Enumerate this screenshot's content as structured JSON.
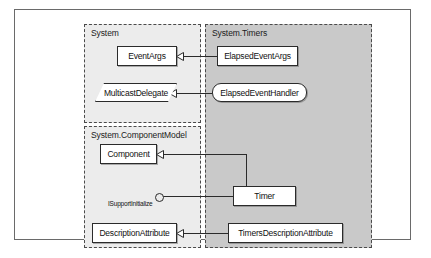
{
  "diagram": {
    "type": "uml-class-diagram",
    "colors": {
      "frame_border": "#6a6a6a",
      "package_border": "#4a4a4a",
      "package_fill_light": "#ececec",
      "package_fill_dark": "#c9c9c9",
      "node_fill": "#ffffff",
      "node_border": "#2b2b2b",
      "connector": "#2b2b2b"
    },
    "packages": [
      {
        "id": "system",
        "label": "System",
        "fill": "#ececec"
      },
      {
        "id": "componentmodel",
        "label": "System.ComponentModel",
        "fill": "#ececec"
      },
      {
        "id": "timers",
        "label": "System.Timers",
        "fill": "#c9c9c9"
      }
    ],
    "nodes": [
      {
        "id": "eventargs",
        "label": "EventArgs",
        "shape": "rect",
        "package": "system"
      },
      {
        "id": "multicastdelegate",
        "label": "MulticastDelegate",
        "shape": "parallelogram",
        "package": "system"
      },
      {
        "id": "elapsedeventargs",
        "label": "ElapsedEventArgs",
        "shape": "rect",
        "package": "timers"
      },
      {
        "id": "elapsedeventhandler",
        "label": "ElapsedEventHandler",
        "shape": "octagon",
        "package": "timers"
      },
      {
        "id": "component",
        "label": "Component",
        "shape": "rect",
        "package": "componentmodel"
      },
      {
        "id": "descriptionattribute",
        "label": "DescriptionAttribute",
        "shape": "rect",
        "package": "componentmodel"
      },
      {
        "id": "timer",
        "label": "Timer",
        "shape": "rect",
        "package": "timers"
      },
      {
        "id": "timersdescriptionattribute",
        "label": "TimersDescriptionAttribute",
        "shape": "rect",
        "package": "timers"
      }
    ],
    "interfaces": [
      {
        "id": "isupportinitialize",
        "label": "ISupportInitialize",
        "notation": "lollipop",
        "implemented_by": "timer"
      }
    ],
    "relationships": [
      {
        "from": "elapsedeventargs",
        "to": "eventargs",
        "type": "inheritance"
      },
      {
        "from": "elapsedeventhandler",
        "to": "multicastdelegate",
        "type": "inheritance"
      },
      {
        "from": "timer",
        "to": "component",
        "type": "inheritance"
      },
      {
        "from": "timer",
        "to": "isupportinitialize",
        "type": "realization"
      },
      {
        "from": "timersdescriptionattribute",
        "to": "descriptionattribute",
        "type": "inheritance"
      }
    ]
  }
}
